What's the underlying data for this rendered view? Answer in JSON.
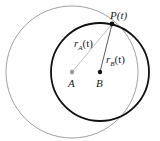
{
  "diagram": {
    "points": {
      "A": {
        "label": "A",
        "x": 72,
        "y": 72,
        "color": "#9a9a9a"
      },
      "B": {
        "label": "B",
        "x": 100,
        "y": 72,
        "color": "#111111"
      },
      "P": {
        "label": "P(t)",
        "x": 112,
        "y": 24,
        "color": "#111111"
      }
    },
    "circles": [
      {
        "center": "A",
        "r": 66,
        "color": "#a0a0a0",
        "width": 1
      },
      {
        "center": "B",
        "r": 49,
        "color": "#111111",
        "width": 1.8
      }
    ],
    "segments": [
      {
        "from": "A",
        "to": "P",
        "label_main": "r",
        "label_sub": "A",
        "label_tail": "(t)",
        "color": "#b0b0b0"
      },
      {
        "from": "B",
        "to": "P",
        "label_main": "r",
        "label_sub": "B",
        "label_tail": "(t)",
        "color": "#333333"
      }
    ]
  }
}
